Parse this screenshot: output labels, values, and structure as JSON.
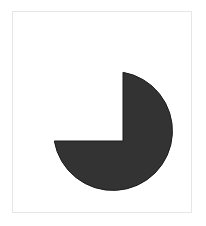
{
  "figure": {
    "shape": "three-quarter-circle",
    "fill_color": "#333333",
    "stroke_color": "#1a1a1a",
    "frame_border_color": "#e6e6e6",
    "background_color": "#ffffff"
  }
}
